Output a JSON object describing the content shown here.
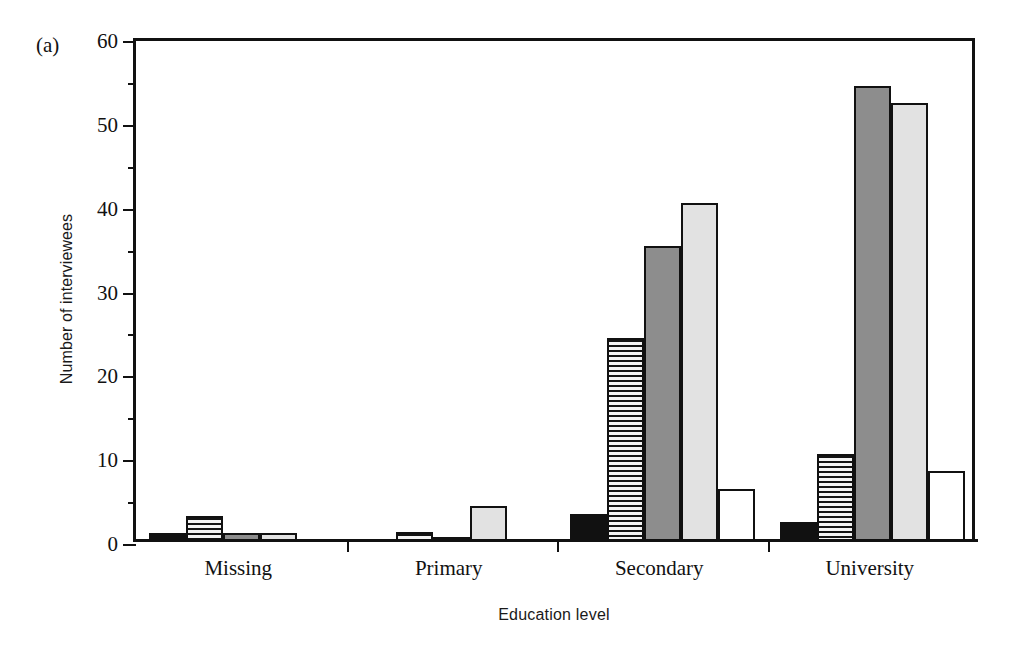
{
  "figure": {
    "panel_label": "(a)",
    "xlabel": "Education level",
    "ylabel": "Number of interviewees"
  },
  "chart_data": {
    "type": "bar",
    "title": "",
    "panel": "(a)",
    "xlabel": "Education level",
    "ylabel": "Number of interviewees",
    "ylim": [
      0,
      60
    ],
    "yticks": [
      0,
      10,
      20,
      30,
      40,
      50,
      60
    ],
    "ytick_labels": [
      "0",
      "10",
      "20",
      "30",
      "40",
      "50",
      "60"
    ],
    "yminor_ticks": [
      5,
      15,
      25,
      35,
      45,
      55
    ],
    "grid": false,
    "legend": "none",
    "categories": [
      "Missing",
      "Primary",
      "Secondary",
      "University"
    ],
    "series": [
      {
        "name": "series-1",
        "style": "black",
        "color": "#111111",
        "values": [
          1.0,
          0.0,
          3.2,
          2.3
        ]
      },
      {
        "name": "series-2",
        "style": "hatched",
        "color": "#f2f2f2",
        "values": [
          3.0,
          1.1,
          24.2,
          10.4
        ]
      },
      {
        "name": "series-3",
        "style": "gray",
        "color": "#8d8d8d",
        "values": [
          1.0,
          0.2,
          35.2,
          54.3
        ]
      },
      {
        "name": "series-4",
        "style": "light-gray",
        "color": "#e2e2e2",
        "values": [
          1.0,
          4.2,
          40.3,
          52.3
        ]
      },
      {
        "name": "series-5",
        "style": "white",
        "color": "#ffffff",
        "values": [
          0.0,
          0.0,
          6.2,
          8.3
        ]
      }
    ]
  }
}
